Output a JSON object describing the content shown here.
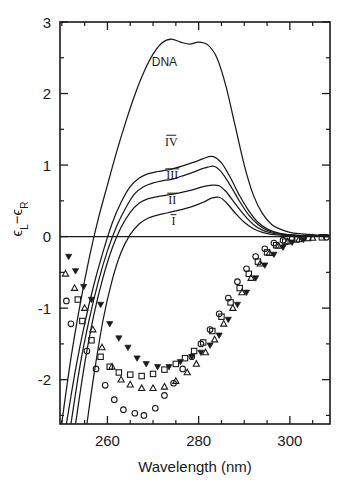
{
  "chart_data": {
    "type": "line",
    "title": "",
    "xlabel": "Wavelength (nm)",
    "ylabel": "εL − εR",
    "ylabel_parts": {
      "eps1": "ϵ",
      "sub1": "L",
      "minus": "−",
      "eps2": "ϵ",
      "sub2": "R"
    },
    "xlim": [
      249.6,
      308.8
    ],
    "ylim": [
      -2.62,
      3.0
    ],
    "xticks": [
      260,
      280,
      300
    ],
    "xtick_labels": [
      "260",
      "280",
      "300"
    ],
    "xticks_minor": [
      250,
      255,
      265,
      270,
      275,
      285,
      290,
      295,
      305
    ],
    "yticks": [
      -2,
      -1,
      0,
      1,
      2,
      3
    ],
    "ytick_labels": [
      "-2",
      "-1",
      "0",
      "1",
      "2",
      "3"
    ],
    "yticks_minor": [
      -2.5,
      -1.5,
      -0.5,
      0.5,
      1.5,
      2.5
    ],
    "grid": false,
    "legend": "inline-curve-labels",
    "annotations": [
      {
        "text": "DNA",
        "x": 272.5,
        "y": 2.38
      },
      {
        "text": "IV",
        "x": 274.0,
        "y": 1.27
      },
      {
        "text": "III",
        "x": 274.2,
        "y": 0.8
      },
      {
        "text": "II",
        "x": 274.2,
        "y": 0.46
      },
      {
        "text": "I",
        "x": 274.5,
        "y": 0.16
      }
    ],
    "series": [
      {
        "name": "DNA",
        "marker": "none",
        "x": [
          250.0,
          252.0,
          254.0,
          256.0,
          258.0,
          260.0,
          262.0,
          264.0,
          266.0,
          268.0,
          270.0,
          272.0,
          274.0,
          276.0,
          278.0,
          280.0,
          282.0,
          284.0,
          286.0,
          288.0,
          290.0,
          292.0,
          294.0,
          296.0,
          298.0,
          300.0,
          302.0,
          304.0,
          306.0,
          308.5
        ],
        "y": [
          -2.6,
          -1.7,
          -0.95,
          -0.3,
          0.25,
          0.72,
          1.18,
          1.6,
          1.98,
          2.3,
          2.55,
          2.71,
          2.76,
          2.72,
          2.69,
          2.72,
          2.68,
          2.5,
          2.1,
          1.55,
          1.0,
          0.58,
          0.32,
          0.17,
          0.1,
          0.06,
          0.04,
          0.03,
          0.02,
          0.02
        ]
      },
      {
        "name": "IV",
        "marker": "none",
        "x": [
          251.0,
          253.0,
          255.0,
          257.0,
          259.0,
          261.0,
          263.0,
          265.0,
          267.0,
          269.0,
          271.0,
          273.0,
          275.0,
          277.0,
          279.0,
          281.0,
          283.0,
          285.0,
          287.0,
          289.0,
          291.0,
          293.0,
          295.0,
          297.0,
          299.0,
          301.0,
          303.0,
          305.0,
          308.5
        ],
        "y": [
          -2.62,
          -1.86,
          -1.22,
          -0.68,
          -0.22,
          0.18,
          0.48,
          0.7,
          0.82,
          0.88,
          0.91,
          0.93,
          0.96,
          1.0,
          1.04,
          1.09,
          1.12,
          1.03,
          0.82,
          0.57,
          0.36,
          0.2,
          0.11,
          0.06,
          0.03,
          0.02,
          0.01,
          0.01,
          0.01
        ]
      },
      {
        "name": "III",
        "marker": "none",
        "x": [
          252.0,
          254.0,
          256.0,
          258.0,
          260.0,
          262.0,
          264.0,
          266.0,
          268.0,
          270.0,
          272.0,
          274.0,
          276.0,
          278.0,
          280.0,
          282.0,
          283.5,
          285.0,
          287.0,
          289.0,
          291.0,
          293.0,
          295.0,
          297.0,
          299.0,
          301.0,
          303.0,
          305.0,
          308.5
        ],
        "y": [
          -2.62,
          -1.8,
          -1.16,
          -0.63,
          -0.2,
          0.14,
          0.4,
          0.6,
          0.7,
          0.75,
          0.78,
          0.8,
          0.84,
          0.88,
          0.93,
          0.97,
          0.98,
          0.9,
          0.71,
          0.49,
          0.3,
          0.17,
          0.09,
          0.05,
          0.03,
          0.02,
          0.01,
          0.01,
          0.01
        ]
      },
      {
        "name": "II",
        "marker": "none",
        "x": [
          253.0,
          255.0,
          257.0,
          259.0,
          261.0,
          263.0,
          265.0,
          267.0,
          269.0,
          271.0,
          273.0,
          275.0,
          277.0,
          279.0,
          281.0,
          283.0,
          284.5,
          286.0,
          288.0,
          290.0,
          292.0,
          294.0,
          296.0,
          298.0,
          300.0,
          302.0,
          304.0,
          308.5
        ],
        "y": [
          -2.62,
          -1.78,
          -1.1,
          -0.58,
          -0.17,
          0.13,
          0.34,
          0.47,
          0.53,
          0.56,
          0.58,
          0.6,
          0.63,
          0.66,
          0.7,
          0.72,
          0.71,
          0.63,
          0.46,
          0.3,
          0.17,
          0.09,
          0.05,
          0.03,
          0.02,
          0.01,
          0.01,
          0.01
        ]
      },
      {
        "name": "I",
        "marker": "none",
        "x": [
          255.5,
          257.0,
          259.0,
          261.0,
          263.0,
          265.0,
          267.0,
          269.0,
          271.0,
          273.0,
          275.0,
          277.0,
          279.0,
          281.0,
          283.0,
          284.5,
          286.0,
          288.0,
          290.0,
          292.0,
          294.0,
          296.0,
          298.0,
          300.0,
          302.0,
          304.0,
          308.5
        ],
        "y": [
          -2.62,
          -1.95,
          -1.18,
          -0.62,
          -0.22,
          0.03,
          0.18,
          0.26,
          0.3,
          0.33,
          0.36,
          0.39,
          0.43,
          0.48,
          0.54,
          0.55,
          0.48,
          0.33,
          0.2,
          0.11,
          0.06,
          0.03,
          0.02,
          0.01,
          0.01,
          0.01,
          0.01
        ]
      }
    ],
    "scatter_series": [
      {
        "name": "circle",
        "marker": "open-circle",
        "points": [
          [
            251.0,
            -0.9
          ],
          [
            252.0,
            -1.22
          ],
          [
            255.5,
            -1.6
          ],
          [
            257.5,
            -1.85
          ],
          [
            259.5,
            -2.08
          ],
          [
            261.5,
            -2.28
          ],
          [
            263.5,
            -2.42
          ],
          [
            266.0,
            -2.47
          ],
          [
            268.0,
            -2.5
          ],
          [
            270.5,
            -2.4
          ],
          [
            272.5,
            -2.22
          ],
          [
            274.5,
            -2.05
          ],
          [
            276.5,
            -1.85
          ],
          [
            278.5,
            -1.68
          ],
          [
            280.5,
            -1.5
          ],
          [
            282.5,
            -1.3
          ],
          [
            284.5,
            -1.08
          ],
          [
            286.5,
            -0.86
          ],
          [
            288.5,
            -0.63
          ],
          [
            290.5,
            -0.45
          ],
          [
            292.5,
            -0.28
          ],
          [
            294.5,
            -0.17
          ],
          [
            296.5,
            -0.09
          ],
          [
            298.5,
            -0.05
          ],
          [
            300.5,
            -0.03
          ],
          [
            303.0,
            -0.02
          ],
          [
            308.0,
            -0.01
          ]
        ]
      },
      {
        "name": "triangle-up",
        "marker": "open-triangle-up",
        "points": [
          [
            250.8,
            -0.52
          ],
          [
            252.8,
            -0.72
          ],
          [
            255.0,
            -1.0
          ],
          [
            256.8,
            -1.3
          ],
          [
            258.8,
            -1.55
          ],
          [
            261.0,
            -1.82
          ],
          [
            263.0,
            -2.0
          ],
          [
            265.0,
            -2.07
          ],
          [
            267.5,
            -2.12
          ],
          [
            270.0,
            -2.12
          ],
          [
            272.5,
            -2.1
          ],
          [
            275.0,
            -2.02
          ],
          [
            277.5,
            -1.9
          ],
          [
            279.5,
            -1.78
          ],
          [
            281.5,
            -1.62
          ],
          [
            283.5,
            -1.44
          ],
          [
            285.5,
            -1.22
          ],
          [
            287.5,
            -1.0
          ],
          [
            289.5,
            -0.78
          ],
          [
            291.5,
            -0.58
          ],
          [
            293.5,
            -0.38
          ],
          [
            295.5,
            -0.23
          ],
          [
            297.5,
            -0.13
          ],
          [
            299.5,
            -0.07
          ],
          [
            302.0,
            -0.04
          ],
          [
            305.0,
            -0.02
          ]
        ]
      },
      {
        "name": "square",
        "marker": "open-square",
        "points": [
          [
            253.5,
            -0.88
          ],
          [
            254.5,
            -1.18
          ],
          [
            256.5,
            -1.45
          ],
          [
            258.5,
            -1.68
          ],
          [
            260.5,
            -1.82
          ],
          [
            262.5,
            -1.9
          ],
          [
            265.0,
            -1.93
          ],
          [
            267.5,
            -1.95
          ],
          [
            270.0,
            -1.92
          ],
          [
            272.5,
            -1.86
          ],
          [
            275.0,
            -1.78
          ],
          [
            277.0,
            -1.7
          ],
          [
            279.0,
            -1.6
          ],
          [
            281.0,
            -1.48
          ],
          [
            283.0,
            -1.32
          ],
          [
            285.0,
            -1.12
          ],
          [
            287.0,
            -0.92
          ],
          [
            289.0,
            -0.72
          ],
          [
            291.0,
            -0.52
          ],
          [
            293.0,
            -0.35
          ],
          [
            295.0,
            -0.22
          ],
          [
            297.0,
            -0.12
          ],
          [
            299.0,
            -0.07
          ],
          [
            301.5,
            -0.04
          ],
          [
            304.0,
            -0.02
          ],
          [
            307.0,
            -0.01
          ]
        ]
      },
      {
        "name": "triangle-down",
        "marker": "solid-triangle-down",
        "points": [
          [
            251.5,
            -0.28
          ],
          [
            253.0,
            -0.48
          ],
          [
            254.8,
            -0.7
          ],
          [
            256.5,
            -0.88
          ],
          [
            258.5,
            -0.95
          ],
          [
            260.5,
            -1.22
          ],
          [
            262.5,
            -1.42
          ],
          [
            264.5,
            -1.55
          ],
          [
            266.5,
            -1.7
          ],
          [
            268.5,
            -1.78
          ],
          [
            271.0,
            -1.82
          ],
          [
            273.5,
            -1.82
          ],
          [
            276.0,
            -1.75
          ],
          [
            278.5,
            -1.68
          ],
          [
            280.5,
            -1.62
          ],
          [
            282.5,
            -1.52
          ],
          [
            284.5,
            -1.38
          ],
          [
            286.5,
            -1.16
          ],
          [
            288.5,
            -0.95
          ],
          [
            290.5,
            -0.78
          ],
          [
            292.5,
            -0.58
          ],
          [
            294.5,
            -0.4
          ],
          [
            296.5,
            -0.25
          ],
          [
            298.5,
            -0.15
          ],
          [
            300.5,
            -0.08
          ],
          [
            303.0,
            -0.04
          ]
        ]
      }
    ]
  }
}
